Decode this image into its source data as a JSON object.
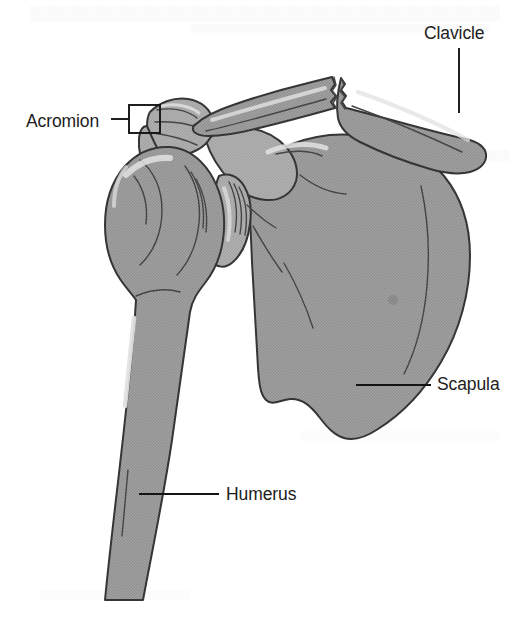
{
  "figure": {
    "background_color": "#ffffff",
    "width": 526,
    "height": 626
  },
  "style": {
    "bone_fill": "#9c9c9c",
    "bone_fill_light": "#ababab",
    "bone_outline": "#353535",
    "label_color": "#1c1c1c",
    "leader_color": "#141414",
    "highlight_color": "#e2e2e2"
  },
  "labels": [
    {
      "id": "clavicle",
      "text": "Clavicle",
      "text_x": 424,
      "text_y": 39,
      "leader_type": "vertical",
      "anchor": "start"
    },
    {
      "id": "acromion",
      "text": "Acromion",
      "text_x": 26,
      "text_y": 127,
      "leader_type": "horizontal-box",
      "anchor": "start"
    },
    {
      "id": "scapula",
      "text": "Scapula",
      "text_x": 437,
      "text_y": 390,
      "leader_type": "horizontal",
      "anchor": "start"
    },
    {
      "id": "humerus",
      "text": "Humerus",
      "text_x": 226,
      "text_y": 500,
      "leader_type": "horizontal",
      "anchor": "start"
    }
  ],
  "bones": [
    {
      "id": "clavicle",
      "name": "Clavicle",
      "feature": "midshaft fracture with jagged bone ends"
    },
    {
      "id": "scapula",
      "name": "Scapula",
      "feature": "large triangular blade with acromion and glenoid"
    },
    {
      "id": "humerus",
      "name": "Humerus",
      "feature": "rounded humeral head with long descending shaft"
    },
    {
      "id": "acromion",
      "name": "Acromion",
      "feature": "lateral bony projection of scapular spine"
    }
  ]
}
